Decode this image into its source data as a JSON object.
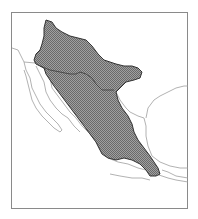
{
  "map": {
    "title": "Species range map",
    "region": "Mexico and southwestern United States",
    "legend": "Shaded area indicates distribution range",
    "colors": {
      "frame": "#8a8a8a",
      "coastline": "#9a9a9a",
      "range_fill": "#8c8c8c",
      "range_outline": "#333333",
      "background": "#ffffff"
    }
  }
}
